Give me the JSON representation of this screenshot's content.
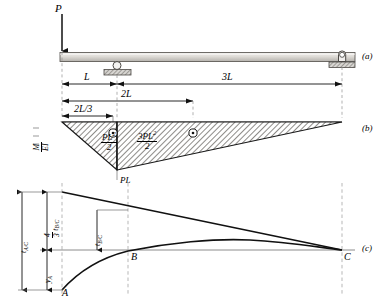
{
  "figure": {
    "type": "beam-moment-area-diagram",
    "panels": [
      {
        "id": "a",
        "tag": "(a)",
        "desc": "loaded beam with supports"
      },
      {
        "id": "b",
        "tag": "(b)",
        "desc": "M/EI diagram"
      },
      {
        "id": "c",
        "tag": "(c)",
        "desc": "elastic curve / deflection diagram"
      }
    ],
    "panel_tags": {
      "a": "(a)",
      "b": "(b)",
      "c": "(c)"
    }
  },
  "beam": {
    "load_label": "P",
    "dimensions": [
      {
        "name": "L",
        "label": "L"
      },
      {
        "name": "3L",
        "label": "3L"
      },
      {
        "name": "2L",
        "label": "2L"
      },
      {
        "name": "2L/3",
        "label": "2L/3"
      }
    ],
    "dim_L": "L",
    "dim_3L": "3L",
    "dim_2L": "2L",
    "dim_2L_over_3_num": "2L",
    "dim_2L_over_3_den": "3"
  },
  "moment_diagram": {
    "axis_label_parts": {
      "num": "M",
      "den": "EI"
    },
    "area_left": {
      "num_coef": "",
      "num_base": "PL",
      "num_exp": "2",
      "den": "2"
    },
    "area_right": {
      "num_coef": "3",
      "num_base": "PL",
      "num_exp": "2",
      "den": "2"
    },
    "peak_label": "PL",
    "centroid_marker": "centroid-symbol"
  },
  "deflection_diagram": {
    "t_AC": {
      "base": "t",
      "sub": "A/C"
    },
    "t_BC_scaled": {
      "coef_num": "4",
      "coef_den": "3",
      "base": "t",
      "sub": "B/C"
    },
    "t_BC": {
      "base": "t",
      "sub": "B/C"
    },
    "y_A": {
      "base": "y",
      "sub": "A"
    },
    "points": [
      {
        "name": "A",
        "label": "A"
      },
      {
        "name": "B",
        "label": "B"
      },
      {
        "name": "C",
        "label": "C"
      }
    ],
    "point_A": "A",
    "point_B": "B",
    "point_C": "C"
  },
  "colors": {
    "line": "#000000",
    "beam_fill_light": "#e8e6e2",
    "beam_fill_dark": "#bdbab5",
    "hatch": "#6d6a66",
    "dashed": "#9a9a9a",
    "thin": "#555555"
  }
}
